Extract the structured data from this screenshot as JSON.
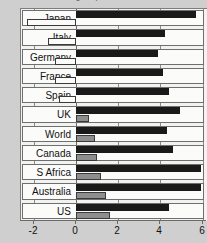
{
  "chart_data": {
    "type": "bar",
    "orientation": "horizontal",
    "title": "Change in price since last rate",
    "title_clipped": true,
    "xlabel": "",
    "ylabel": "",
    "xlim": [
      -2.6,
      6.2
    ],
    "xticks": [
      -2,
      0,
      2,
      4,
      6
    ],
    "xtick_labels": [
      "-2",
      "0",
      "2",
      "4",
      "6"
    ],
    "grid": true,
    "grid_axis": "x",
    "legend_position": "top",
    "categories": [
      "Japan",
      "Italy",
      "Germany",
      "France",
      "Spain",
      "UK",
      "World",
      "Canada",
      "S Africa",
      "Australia",
      "US"
    ],
    "series": [
      {
        "name": "dark-series",
        "color": "#1a1a1a",
        "values": [
          5.7,
          4.2,
          3.9,
          4.1,
          4.4,
          4.9,
          4.3,
          4.6,
          5.9,
          5.9,
          4.4
        ]
      },
      {
        "name": "light-series",
        "color": "#8e8e8e",
        "values": [
          -2.3,
          -1.3,
          -1.0,
          -1.0,
          -0.8,
          0.6,
          0.9,
          1.0,
          1.2,
          1.4,
          1.6
        ]
      }
    ]
  },
  "chart": {
    "title": "Change in price since last rate",
    "legend_swatch": "legend-swatch"
  },
  "axis": {
    "ticks": [
      "-2",
      "0",
      "2",
      "4",
      "6"
    ]
  },
  "rows": [
    {
      "label": "Japan",
      "dark": 5.7,
      "light": -2.3
    },
    {
      "label": "Italy",
      "dark": 4.2,
      "light": -1.3
    },
    {
      "label": "Germany",
      "dark": 3.9,
      "light": -1.0
    },
    {
      "label": "France",
      "dark": 4.1,
      "light": -1.0
    },
    {
      "label": "Spain",
      "dark": 4.4,
      "light": -0.8
    },
    {
      "label": "UK",
      "dark": 4.9,
      "light": 0.6
    },
    {
      "label": "World",
      "dark": 4.3,
      "light": 0.9
    },
    {
      "label": "Canada",
      "dark": 4.6,
      "light": 1.0
    },
    {
      "label": "S Africa",
      "dark": 5.9,
      "light": 1.2
    },
    {
      "label": "Australia",
      "dark": 5.9,
      "light": 1.4
    },
    {
      "label": "US",
      "dark": 4.4,
      "light": 1.6
    }
  ]
}
